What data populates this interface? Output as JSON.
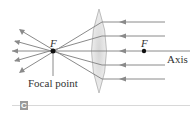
{
  "diagram": {
    "type": "converging-lens-ray-diagram",
    "labels": {
      "focal_left": "F",
      "focal_right": "F",
      "axis": "Axis",
      "focal_point": "Focal point",
      "panel": "C"
    },
    "colors": {
      "ray": "#8a8a8a",
      "lens_fill": "#e4e4e4",
      "lens_stroke": "#b0b0b0",
      "point": "#111111",
      "text": "#333333",
      "panel_tag": "#9a9a9a"
    },
    "rays_incoming_y": [
      22,
      36,
      51,
      65,
      79
    ]
  }
}
